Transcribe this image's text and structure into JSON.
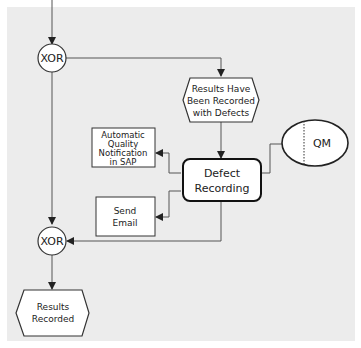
{
  "diagram": {
    "type": "EPC process flow",
    "background_color": "#ececec",
    "nodes": {
      "xor_top": {
        "label": "XOR",
        "shape": "circle"
      },
      "event_defects": {
        "lines": [
          "Results Have",
          "Been Recorded",
          "with Defects"
        ],
        "shape": "hexagon"
      },
      "org_qm": {
        "label": "QM",
        "shape": "ellipse"
      },
      "function_defect": {
        "lines": [
          "Defect",
          "Recording"
        ],
        "shape": "rounded-rect"
      },
      "output_notification": {
        "lines": [
          "Automatic",
          "Quality",
          "Notification",
          "in SAP"
        ],
        "shape": "rect"
      },
      "output_email": {
        "lines": [
          "Send",
          "Email"
        ],
        "shape": "rect"
      },
      "xor_bottom": {
        "label": "XOR",
        "shape": "circle"
      },
      "event_recorded": {
        "lines": [
          "Results",
          "Recorded"
        ],
        "shape": "hexagon"
      }
    }
  }
}
